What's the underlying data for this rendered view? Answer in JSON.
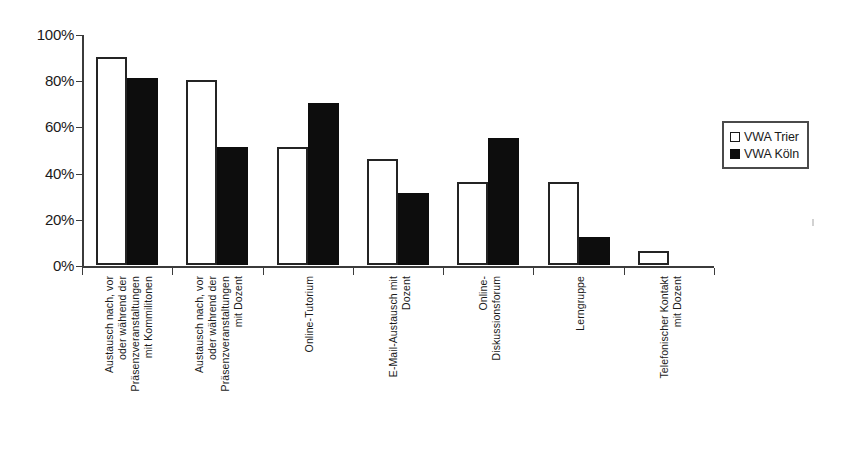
{
  "chart_data": {
    "type": "bar",
    "title": "",
    "subtitle": "",
    "xlabel": "",
    "ylabel": "",
    "ylim": [
      0,
      100
    ],
    "y_ticks": [
      "0%",
      "20%",
      "40%",
      "60%",
      "80%",
      "100%"
    ],
    "y_tick_values": [
      0,
      20,
      40,
      60,
      80,
      100
    ],
    "grid": false,
    "legend_position": "right",
    "value_unit": "%",
    "categories": [
      "Austausch nach, vor oder während der Präsenzveranstaltungen mit Kommilitonen",
      "Austausch nach, vor oder während der Präsenzveranstaltungen mit Dozent",
      "Online-Tutorium",
      "E-Mail-Austausch mit Dozent",
      "Online-Diskussionsforum",
      "Lerngruppe",
      "Telefonischer Kontakt mit Dozent"
    ],
    "category_label_lines": [
      [
        "Austausch nach, vor",
        "oder während der",
        "Präsenzveranstaltungen",
        "mit Kommilitonen"
      ],
      [
        "Austausch nach, vor",
        "oder während der",
        "Präsenzveranstaltungen",
        "mit Dozent"
      ],
      [
        "Online-Tutorium"
      ],
      [
        "E-Mail-Austausch mit",
        "Dozent"
      ],
      [
        "Online-",
        "Diskussionsforum"
      ],
      [
        "Lerngruppe"
      ],
      [
        "Telefonischer Kontakt",
        "mit Dozent"
      ]
    ],
    "series": [
      {
        "name": "VWA Trier",
        "color": "#ffffff",
        "edge_color": "#242424",
        "values": [
          90,
          80,
          51,
          46,
          36,
          36,
          6
        ]
      },
      {
        "name": "VWA Köln",
        "color": "#000000",
        "edge_color": "#000000",
        "values": [
          81,
          51,
          70,
          31,
          55,
          12,
          0
        ]
      }
    ]
  },
  "legend": {
    "entries": [
      {
        "label": "VWA Trier",
        "swatch": "white-square-icon"
      },
      {
        "label": "VWA Köln",
        "swatch": "black-square-icon"
      }
    ]
  }
}
